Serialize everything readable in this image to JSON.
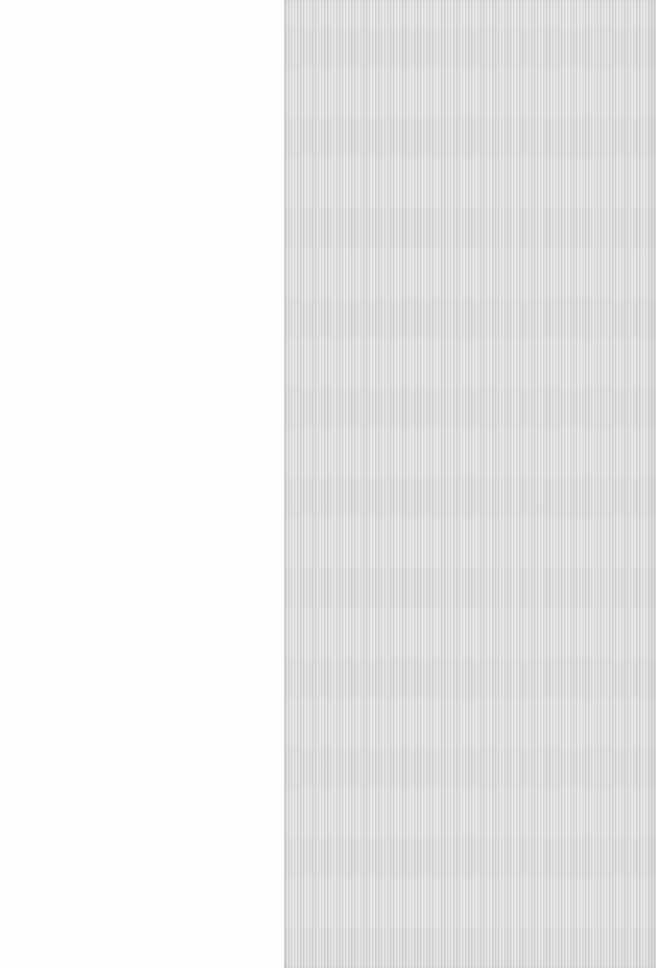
{
  "regions": {
    "left": {
      "color": "#fefefe"
    },
    "right": {
      "color": "#dcdcdc",
      "texture": "vertical-stripes"
    }
  }
}
